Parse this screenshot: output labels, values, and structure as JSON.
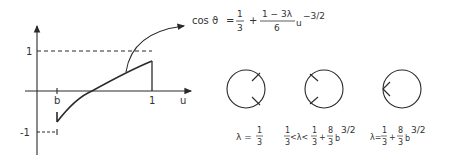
{
  "plot": {
    "y_tick_top": "1",
    "y_tick_bottom": "-1",
    "x_tick_b": "b",
    "x_tick_1": "1",
    "x_axis_label": "u"
  },
  "formula": {
    "lhs": "cos ϑ",
    "eq": "=",
    "frac1_num": "1",
    "frac1_den": "3",
    "plus": "+",
    "frac2_num": "1 − 3λ",
    "frac2_den": "6",
    "var": "u",
    "exponent": "−3/2"
  },
  "cases": [
    {
      "label_parts": {
        "lhs": "λ =",
        "num": "1",
        "den": "3"
      }
    },
    {
      "label_parts": {
        "num1": "1",
        "den1": "3",
        "mid": "<λ<",
        "num2": "1",
        "den2": "3",
        "plus": "+",
        "num3": "8",
        "den3": "3",
        "var": "b",
        "exp": "3/2"
      }
    },
    {
      "label_parts": {
        "lhs": "λ=",
        "num2": "1",
        "den2": "3",
        "plus": "+",
        "num3": "8",
        "den3": "3",
        "var": "b",
        "exp": "3/2"
      }
    }
  ],
  "colors": {
    "stroke": "#2a2a2a",
    "background": "#ffffff"
  }
}
